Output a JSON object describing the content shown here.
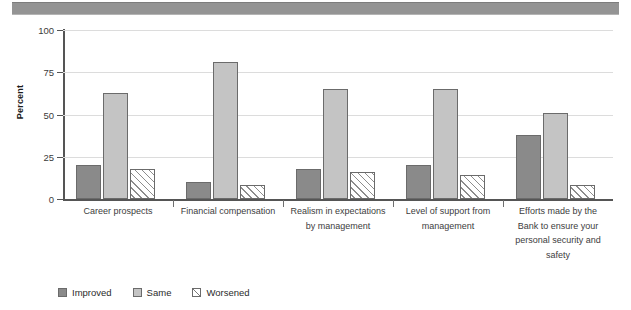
{
  "chart_data": {
    "type": "bar",
    "title": "",
    "xlabel": "",
    "ylabel": "Percent",
    "ylim": [
      0,
      100
    ],
    "yticks": [
      0,
      25,
      50,
      75,
      100
    ],
    "grid": true,
    "legend_position": "bottom-left",
    "categories": [
      "Career prospects",
      "Financial compensation",
      "Realism in expectations by management",
      "Level of support from management",
      "Efforts made by the Bank to ensure your personal security and safety"
    ],
    "category_lines": [
      [
        "Career prospects"
      ],
      [
        "Financial compensation"
      ],
      [
        "Realism in expectations",
        "by management"
      ],
      [
        "Level of support from",
        "management"
      ],
      [
        "Efforts made by the",
        "Bank to ensure your",
        "personal security and",
        "safety"
      ]
    ],
    "series": [
      {
        "name": "Improved",
        "color": "#8a8a8a",
        "values": [
          20,
          10,
          18,
          20,
          38
        ]
      },
      {
        "name": "Same",
        "color": "#c4c4c4",
        "values": [
          63,
          81,
          65,
          65,
          51
        ]
      },
      {
        "name": "Worsened",
        "color": "#ffffff",
        "values": [
          18,
          8,
          16,
          14,
          8
        ]
      }
    ]
  },
  "legend": {
    "items": [
      {
        "label": "Improved",
        "style": "improved"
      },
      {
        "label": "Same",
        "style": "same"
      },
      {
        "label": "Worsened",
        "style": "worsened"
      }
    ]
  },
  "axis": {
    "y_title": "Percent",
    "y_tick_labels": [
      "0",
      "25",
      "50",
      "75",
      "100"
    ]
  }
}
